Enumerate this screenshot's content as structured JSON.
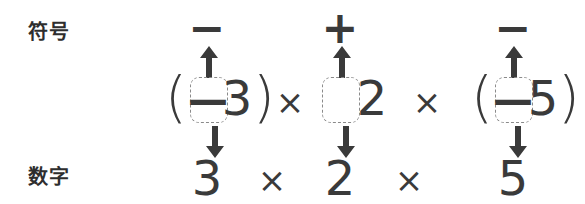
{
  "labels": {
    "sign_row": "符号",
    "number_row": "数字"
  },
  "signs_row": {
    "items": [
      {
        "name": "sign-term-1",
        "value": "−",
        "x": 207
      },
      {
        "name": "sign-term-2",
        "value": "+",
        "x": 340
      },
      {
        "name": "sign-term-3",
        "value": "−",
        "x": 513
      }
    ]
  },
  "expression_row": {
    "term1": {
      "open_paren": "(",
      "inner_sign": "—",
      "digit": "3",
      "close_paren": ")"
    },
    "operator1": "×",
    "term2": {
      "inner_sign": "",
      "digit": "2"
    },
    "operator2": "×",
    "term3": {
      "open_paren": "(",
      "inner_sign": "—",
      "digit": "5",
      "close_paren": ")"
    }
  },
  "numbers_row": {
    "items": [
      {
        "name": "number-term-1",
        "value": "3",
        "x": 207
      },
      {
        "name": "number-operator-1",
        "value": "×",
        "x": 272
      },
      {
        "name": "number-term-2",
        "value": "2",
        "x": 340
      },
      {
        "name": "number-operator-2",
        "value": "×",
        "x": 409
      },
      {
        "name": "number-term-3",
        "value": "5",
        "x": 513
      }
    ]
  },
  "arrows": {
    "up": [
      {
        "name": "up-arrow-term-1",
        "x": 209
      },
      {
        "name": "up-arrow-term-2",
        "x": 342
      },
      {
        "name": "up-arrow-term-3",
        "x": 514
      }
    ],
    "down": [
      {
        "name": "down-arrow-term-1",
        "x": 215
      },
      {
        "name": "down-arrow-term-2",
        "x": 346
      },
      {
        "name": "down-arrow-term-3",
        "x": 518
      }
    ]
  },
  "colors": {
    "ink": "#3a3a3a",
    "dashed_border": "#8a8a8a",
    "background": "#ffffff"
  }
}
